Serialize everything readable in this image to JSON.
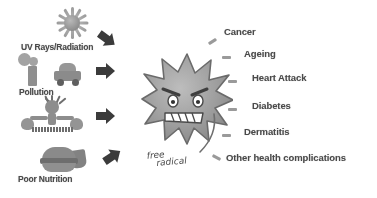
{
  "diagram": {
    "background_color": "#ffffff",
    "ink_color": "#4a4a4a"
  },
  "center": {
    "name": "free-radical-character",
    "handwritten_line1": "free",
    "handwritten_line2": "radical",
    "description": "spiky star burst cartoon with angry face"
  },
  "causes": [
    {
      "id": "uv",
      "label": "UV Rays/Radiation",
      "icon": "sun-icon"
    },
    {
      "id": "pollution",
      "label": "Pollution",
      "icon": "factory-car-icon"
    },
    {
      "id": "stress",
      "label": "STRESS",
      "icon": "stressed-person-icon"
    },
    {
      "id": "nutrition",
      "label": "Poor Nutrition",
      "icon": "fast-food-icon"
    }
  ],
  "arrows": [
    {
      "id": "arrow-uv",
      "direction": "down-right"
    },
    {
      "id": "arrow-pollution",
      "direction": "right"
    },
    {
      "id": "arrow-stress",
      "direction": "right"
    },
    {
      "id": "arrow-nutrition",
      "direction": "up-right"
    }
  ],
  "effects": [
    {
      "id": "cancer",
      "label": "Cancer"
    },
    {
      "id": "ageing",
      "label": "Ageing"
    },
    {
      "id": "heart-attack",
      "label": "Heart Attack"
    },
    {
      "id": "diabetes",
      "label": "Diabetes"
    },
    {
      "id": "dermatitis",
      "label": "Dermatitis"
    },
    {
      "id": "other",
      "label": "Other health complications"
    }
  ]
}
